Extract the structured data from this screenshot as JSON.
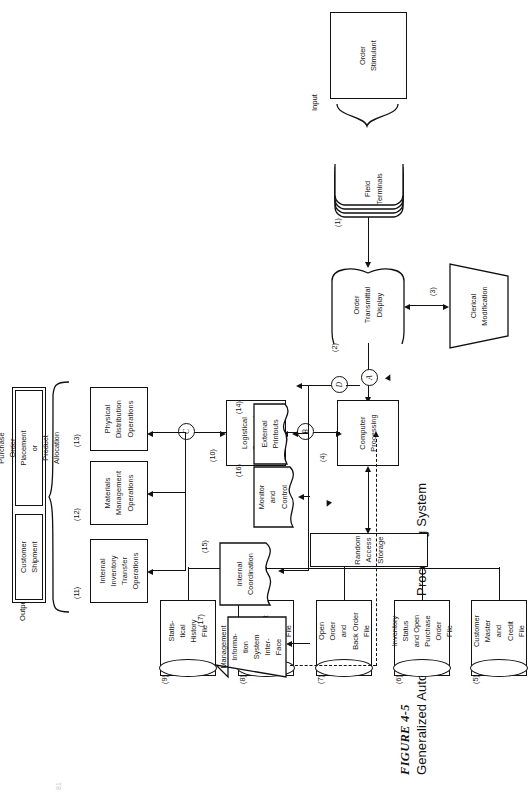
{
  "figure": {
    "label": "FIGURE 4-5",
    "title": "Generalized Automated Order Processing System",
    "page_number": "81"
  },
  "sections": {
    "input_caption": "Input",
    "output_caption": "Output"
  },
  "input_panel": {
    "cells": [
      {
        "id": "order-stimulant",
        "text": "Order\nStimulant"
      }
    ]
  },
  "output_panel": {
    "cells": [
      {
        "id": "customer-shipment",
        "text": "Customer\nShipment"
      },
      {
        "id": "purchase-order-placement",
        "text": "Purchase\nOrder\nPlacement\nor\nProduct\nAllocation"
      }
    ]
  },
  "nodes": [
    {
      "num": "(1)",
      "id": "field-terminals",
      "shape": "stack",
      "text": "Field\nTerminals"
    },
    {
      "num": "(2)",
      "id": "order-transmittal-display",
      "shape": "display",
      "text": "Order\nTransmittal\nDisplay"
    },
    {
      "num": "(3)",
      "id": "clerical-modification",
      "shape": "trapezoid",
      "text": "Clerical\nModification"
    },
    {
      "num": "(4)",
      "id": "computer-processing",
      "shape": "rect",
      "text": "Computer\nProcessing"
    },
    {
      "num": "(5)",
      "id": "customer-master-credit-file",
      "shape": "drum",
      "text": "Customer\nMaster\nand\nCredit\nFile"
    },
    {
      "num": "(6)",
      "id": "inventory-status-po-file",
      "shape": "drum",
      "text": "Inventory\nStatus\nand Open\nPurchase\nOrder\nFile"
    },
    {
      "num": "(7)",
      "id": "open-order-back-order-file",
      "shape": "drum",
      "text": "Open\nOrder\nand\nBack Order\nFile"
    },
    {
      "num": "(8)",
      "id": "pricing-transport-data-file",
      "shape": "drum",
      "text": "Pricing\nand\nTransport\nData\nFile"
    },
    {
      "num": "(9)",
      "id": "statistical-history-file",
      "shape": "drum",
      "text": "Statis-\ntical\nHistory\nFile"
    },
    {
      "num": "(10)",
      "id": "logistical-command-function",
      "shape": "rect",
      "text": "Logistical\nCommand\nFunction"
    },
    {
      "num": "(11)",
      "id": "internal-inventory-transfer",
      "shape": "rect",
      "text": "Internal\nInventory\nTransfer\nOperations"
    },
    {
      "num": "(12)",
      "id": "materials-management",
      "shape": "rect",
      "text": "Materials\nManagement\nOperations"
    },
    {
      "num": "(13)",
      "id": "physical-distribution",
      "shape": "rect",
      "text": "Physical\nDistribution\nOperations"
    },
    {
      "num": "(14)",
      "id": "external-printouts",
      "shape": "document",
      "text": "External\nPrintouts"
    },
    {
      "num": "(15)",
      "id": "internal-coordination",
      "shape": "document",
      "text": "Internal\nCoordination"
    },
    {
      "num": "(16)",
      "id": "monitor-and-control",
      "shape": "document",
      "text": "Monitor\nand\nControl"
    },
    {
      "num": "(17)",
      "id": "management-info-interface",
      "shape": "trapezoid",
      "text": "Management\nInforma-\ntion\nSystem\nInter-\nFace"
    }
  ],
  "storage_bar": {
    "id": "random-access-storage",
    "text": "Random Access Storage"
  },
  "connectors": [
    {
      "id": "connector-a",
      "letter": "A"
    },
    {
      "id": "connector-b",
      "letter": "B"
    },
    {
      "id": "connector-c",
      "letter": "C"
    },
    {
      "id": "connector-d",
      "letter": "D"
    }
  ],
  "colors": {
    "ink": "#111111",
    "paper": "#ffffff",
    "page_number": "#c8c8c8"
  }
}
